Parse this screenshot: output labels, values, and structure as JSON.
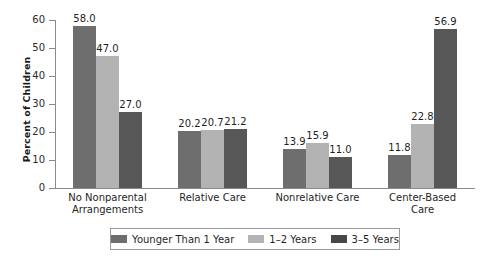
{
  "chart_data": {
    "type": "bar",
    "title": "",
    "xlabel": "",
    "ylabel": "Percent of Children",
    "ylim": [
      0,
      60
    ],
    "ytick_step": 10,
    "yticks": [
      "60",
      "50",
      "40",
      "30",
      "20",
      "10",
      "0"
    ],
    "grid": false,
    "legend_position": "bottom",
    "categories": [
      "No Nonparental Arrangements",
      "Relative Care",
      "Nonrelative Care",
      "Center-Based Care"
    ],
    "category_lines": [
      [
        "No Nonparental",
        "Arrangements"
      ],
      [
        "Relative Care"
      ],
      [
        "Nonrelative Care"
      ],
      [
        "Center-Based",
        "Care"
      ]
    ],
    "series": [
      {
        "name": "Younger Than 1 Year",
        "color": "#6e6e6e",
        "values": [
          58.0,
          20.2,
          13.9,
          11.8
        ],
        "labels": [
          "58.0",
          "20.2",
          "13.9",
          "11.8"
        ]
      },
      {
        "name": "1–2 Years",
        "color": "#b3b3b3",
        "values": [
          47.0,
          20.7,
          15.9,
          22.8
        ],
        "labels": [
          "47.0",
          "20.7",
          "15.9",
          "22.8"
        ]
      },
      {
        "name": "3–5 Years",
        "color": "#575757",
        "values": [
          27.0,
          21.2,
          11.0,
          56.9
        ],
        "labels": [
          "27.0",
          "21.2",
          "11.0",
          "56.9"
        ]
      }
    ]
  },
  "axis": {
    "y_label": "Percent of Children",
    "ticks": [
      {
        "value": "60"
      },
      {
        "value": "50"
      },
      {
        "value": "40"
      },
      {
        "value": "30"
      },
      {
        "value": "20"
      },
      {
        "value": "10"
      },
      {
        "value": "0"
      }
    ]
  },
  "legend": {
    "items": [
      {
        "label": "Younger Than 1 Year",
        "color": "#6e6e6e"
      },
      {
        "label": "1–2 Years",
        "color": "#b3b3b3"
      },
      {
        "label": "3–5 Years",
        "color": "#474747"
      }
    ]
  }
}
